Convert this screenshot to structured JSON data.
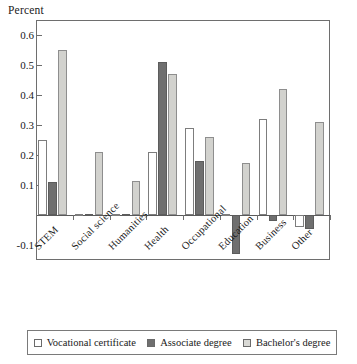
{
  "chart_data": {
    "type": "bar",
    "title": "",
    "subtitle": "",
    "xlabel": "",
    "ylabel": "Percent",
    "ylim": [
      -0.15,
      0.65
    ],
    "yticks": [
      0.6,
      0.5,
      0.4,
      0.3,
      0.2,
      0.1,
      -0.1
    ],
    "ytick_labels": [
      "0.6",
      "0.5",
      "0.4",
      "0.3",
      "0.2",
      "0.1",
      "-0.1"
    ],
    "grid": false,
    "legend_position": "bottom",
    "categories": [
      "STEM",
      "Social science",
      "Humanities",
      "Health",
      "Occupational",
      "Education",
      "Business",
      "Other"
    ],
    "series": [
      {
        "name": "Vocational certificate",
        "color": "#ffffff",
        "values": [
          0.25,
          0.005,
          0.005,
          0.21,
          0.29,
          0.005,
          0.32,
          -0.04
        ]
      },
      {
        "name": "Associate degree",
        "color": "#6f6f6f",
        "values": [
          0.11,
          0.005,
          0.005,
          0.51,
          0.18,
          -0.13,
          -0.02,
          -0.045
        ]
      },
      {
        "name": "Bachelor's degree",
        "color": "#d2d2ce",
        "values": [
          0.55,
          0.21,
          0.115,
          0.47,
          0.26,
          0.175,
          0.42,
          0.31
        ]
      }
    ]
  },
  "legend": {
    "items": [
      {
        "label": "Vocational certificate",
        "swatch": "vocational"
      },
      {
        "label": "Associate degree",
        "swatch": "associate"
      },
      {
        "label": "Bachelor's degree",
        "swatch": "bachelor"
      }
    ]
  }
}
